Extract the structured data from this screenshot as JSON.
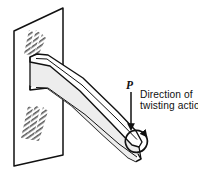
{
  "figure": {
    "background_color": "#ffffff",
    "ink_color": "#111111",
    "hatch_color": "#555555",
    "beam_face_color": "#ffffff",
    "beam_shade_color": "#d8d8d8"
  },
  "labels": {
    "load_point": "P",
    "caption_line_1": "Direction of",
    "caption_line_2": "twisting action"
  },
  "icons": {
    "force_arrow": "downward-arrow-icon",
    "twist_arrow": "curved-rotation-arrow-icon",
    "wall_hatch": "hatch-pattern-icon"
  },
  "geometry": {
    "wall_plate": {
      "name": "support-wall-plate",
      "points": "14,31 63,8 63,155 14,166"
    },
    "hatch_patches": [
      {
        "name": "hatch-patch-upper",
        "x": 22,
        "y": 28,
        "w": 26,
        "h": 26
      },
      {
        "name": "hatch-patch-lower",
        "x": 20,
        "y": 104,
        "w": 30,
        "h": 36
      }
    ],
    "beam": {
      "name": "cantilever-beam",
      "top_flange_outline": "30,57 37,54 48,55 83,78 118,112 136,131 142,142 139,147 132,145 112,124 80,91 50,66",
      "bottom_flange_outline": "30,86 37,83 49,84 86,110 120,140 138,154 141,159 136,161 128,157 104,136 72,106 47,88",
      "web_left": "30,57 30,86",
      "web_shade": "36,60 44,60 80,92 116,126 137,147 136,150 104,121 70,89 40,66"
    },
    "force_arrow": {
      "name": "end-load-arrow",
      "x1": 131,
      "y1": 92,
      "x2": 131,
      "y2": 127
    },
    "twist_arrow": {
      "name": "twisting-action-arrow",
      "center_x": 152,
      "center_y": 127,
      "radius": 11
    }
  }
}
